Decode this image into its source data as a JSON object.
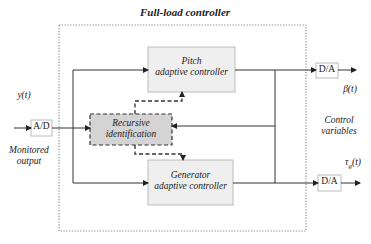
{
  "title": "Full-load controller",
  "blocks": {
    "pitch": {
      "line1": "Pitch",
      "line2": "adaptive controller"
    },
    "recursive": {
      "line1": "Recursive",
      "line2": "identification"
    },
    "generator": {
      "line1": "Generator",
      "line2": "adaptive controller"
    },
    "ad": "A/D",
    "da_top": "D/A",
    "da_bottom": "D/A"
  },
  "signals": {
    "input": "y(t)",
    "input_label_line1": "Monitored",
    "input_label_line2": "output",
    "output_pitch": "β(t)",
    "output_generator_main": "τ",
    "output_generator_sub": "g",
    "output_generator_arg": "(t)",
    "outputs_label_line1": "Control",
    "outputs_label_line2": "variables"
  },
  "colors": {
    "box_fill": "#efefef",
    "recursive_fill": "#d4d4d4",
    "line": "#333333",
    "frame": "#888888"
  }
}
